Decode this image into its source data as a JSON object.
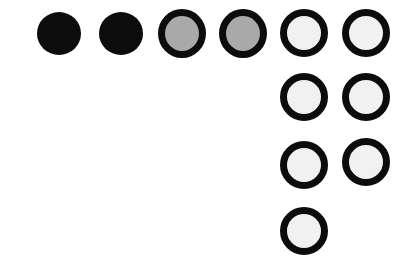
{
  "diagram": {
    "type": "dot-arrangement",
    "colors": {
      "solid_fill": "#0c0c0c",
      "grey_fill": "#a9a9a9",
      "light_fill": "#f1f1f1",
      "outline": "#0c0c0c",
      "background": "#ffffff"
    },
    "dots": [
      {
        "id": "dot-1",
        "style": "solid",
        "cx": 59,
        "cy": 33
      },
      {
        "id": "dot-2",
        "style": "solid",
        "cx": 121,
        "cy": 33
      },
      {
        "id": "dot-3",
        "style": "grey",
        "cx": 182,
        "cy": 33
      },
      {
        "id": "dot-4",
        "style": "grey",
        "cx": 243,
        "cy": 33
      },
      {
        "id": "dot-5",
        "style": "light",
        "cx": 304,
        "cy": 33
      },
      {
        "id": "dot-6",
        "style": "light",
        "cx": 366,
        "cy": 33
      },
      {
        "id": "dot-7",
        "style": "light",
        "cx": 304,
        "cy": 97
      },
      {
        "id": "dot-8",
        "style": "light",
        "cx": 366,
        "cy": 97
      },
      {
        "id": "dot-9",
        "style": "light",
        "cx": 304,
        "cy": 165
      },
      {
        "id": "dot-10",
        "style": "light",
        "cx": 366,
        "cy": 162
      },
      {
        "id": "dot-11",
        "style": "light",
        "cx": 304,
        "cy": 231
      }
    ],
    "counts": {
      "solid": 2,
      "grey": 2,
      "light": 7,
      "total": 11
    }
  }
}
